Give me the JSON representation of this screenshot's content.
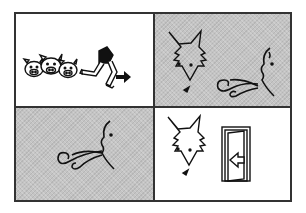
{
  "figure": {
    "type": "picture-story-sequence",
    "layout": "2x2 grid",
    "colors": {
      "border": "#333333",
      "shaded_panel": "#c4c4c4",
      "plain_panel": "#ffffff",
      "ink": "#111111"
    },
    "panels": [
      {
        "position": "top-left",
        "background": "white",
        "content": [
          "three-pig-faces",
          "running-legs",
          "arrow-right"
        ]
      },
      {
        "position": "top-right",
        "background": "shaded",
        "content": [
          "wolf-face",
          "blowing-face-with-wind"
        ]
      },
      {
        "position": "bottom-left",
        "background": "shaded",
        "content": [
          "blowing-face-with-wind"
        ]
      },
      {
        "position": "bottom-right",
        "background": "white",
        "content": [
          "wolf-face",
          "door-with-arrow-in"
        ]
      }
    ]
  }
}
